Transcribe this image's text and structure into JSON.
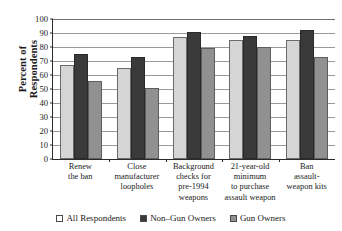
{
  "chart_data": {
    "type": "bar",
    "title": "",
    "xlabel": "",
    "ylabel_lines": [
      "Percent of",
      "Respondents"
    ],
    "ylabel": "Percent of Respondents",
    "ylim": [
      0,
      100
    ],
    "yticks": [
      100,
      90,
      80,
      70,
      60,
      50,
      40,
      30,
      20,
      10,
      0
    ],
    "grid": true,
    "legend_position": "bottom",
    "categories": [
      "Renew\nthe ban",
      "Close\nmanufacturer\nloopholes",
      "Background\nchecks for\npre-1994\nweapons",
      "21-year-old\nminimum\nto purchase\nassault weapon",
      "Ban\nassault-\nweapon kits"
    ],
    "category_lines": [
      [
        "Renew",
        "the ban"
      ],
      [
        "Close",
        "manufacturer",
        "loopholes"
      ],
      [
        "Background",
        "checks for",
        "pre-1994",
        "weapons"
      ],
      [
        "21-year-old",
        "minimum",
        "to purchase",
        "assault weapon"
      ],
      [
        "Ban",
        "assault-",
        "weapon kits"
      ]
    ],
    "series": [
      {
        "name": "All Respondents",
        "color": "#d5d5d5",
        "values": [
          67,
          65,
          87,
          85,
          85
        ]
      },
      {
        "name": "Non–Gun Owners",
        "color": "#3a3a3a",
        "values": [
          75,
          73,
          91,
          88,
          92
        ]
      },
      {
        "name": "Gun Owners",
        "color": "#919191",
        "values": [
          56,
          51,
          79,
          80,
          73
        ]
      }
    ]
  },
  "legend": {
    "items": [
      {
        "label": "All Respondents"
      },
      {
        "label": "Non–Gun Owners"
      },
      {
        "label": "Gun Owners"
      }
    ]
  },
  "colors": {
    "axis": "#2b2b2b",
    "gridline": "#9a9a9a",
    "background": "#ffffff",
    "series_all_respondents": "#d5d5d5",
    "series_non_gun_owners": "#3a3a3a",
    "series_gun_owners": "#919191"
  }
}
